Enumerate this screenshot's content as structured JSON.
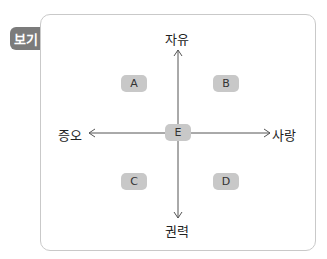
{
  "badge": {
    "label": "보기"
  },
  "axes": {
    "top": "자유",
    "bottom": "권력",
    "left": "증오",
    "right": "사랑"
  },
  "regions": [
    {
      "id": "A",
      "label": "A"
    },
    {
      "id": "B",
      "label": "B"
    },
    {
      "id": "C",
      "label": "C"
    },
    {
      "id": "D",
      "label": "D"
    },
    {
      "id": "E",
      "label": "E"
    }
  ],
  "colors": {
    "box": "#c8c8c8",
    "badge": "#7b7b7b",
    "border": "#c9c9c9",
    "line": "#555555"
  }
}
